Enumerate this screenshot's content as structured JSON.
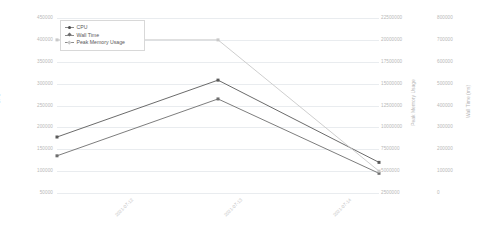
{
  "chart_data": {
    "type": "line",
    "title": "",
    "xlabel": "",
    "grid": true,
    "legend_position": "top-left",
    "categories": [
      "2021-07-12",
      "2021-07-13",
      "2021-07-14"
    ],
    "series": [
      {
        "name": "CPU",
        "axis": "left",
        "color": "#5a5a5a",
        "values": [
          178000,
          308000,
          120000
        ]
      },
      {
        "name": "Wall Time",
        "axis": "right-2",
        "color": "#6e6e6e",
        "values": [
          170000,
          430000,
          90000
        ]
      },
      {
        "name": "Peak Memory Usage",
        "axis": "right-1",
        "color": "#c8c8c8",
        "values": [
          20000000,
          20000000,
          5000000
        ]
      }
    ],
    "axes": {
      "left": {
        "label": "CPU",
        "ticks": [
          450000,
          400000,
          350000,
          300000,
          250000,
          200000,
          150000,
          100000,
          50000
        ],
        "ylim": [
          50000,
          450000
        ]
      },
      "right_1": {
        "label": "Peak Memory Usage",
        "ticks": [
          22500000,
          20000000,
          17500000,
          15000000,
          12500000,
          10000000,
          7500000,
          5000000,
          2500000
        ],
        "ylim": [
          2500000,
          22500000
        ]
      },
      "right_2": {
        "label": "Wall Time (ms)",
        "ticks": [
          800000,
          700000,
          600000,
          500000,
          400000,
          300000,
          200000,
          100000,
          0
        ],
        "ylim": [
          0,
          800000
        ]
      }
    },
    "legend": [
      {
        "label": "CPU",
        "marker": "circle"
      },
      {
        "label": "Wall Time",
        "marker": "diamond"
      },
      {
        "label": "Peak Memory Usage",
        "marker": "diamond"
      }
    ]
  },
  "colors": {
    "background": "#ffffff",
    "gridline": "#e9ecef",
    "tick_text": "#b7b7b7",
    "axis_title": "#9a9a9a"
  }
}
